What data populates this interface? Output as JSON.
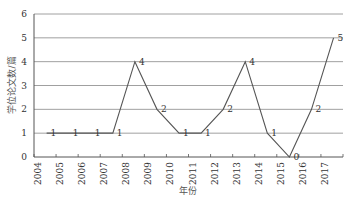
{
  "chart_data": {
    "type": "line",
    "title": "",
    "xlabel": "年份",
    "ylabel": "学位论文数/篇",
    "categories": [
      "2004",
      "2005",
      "2006",
      "2007",
      "2008",
      "2009",
      "2010",
      "2011",
      "2012",
      "2013",
      "2014",
      "2015",
      "2016",
      "2017"
    ],
    "series": [
      {
        "name": "学位论文数",
        "values": [
          1,
          1,
          1,
          1,
          4,
          2,
          1,
          1,
          2,
          4,
          1,
          0,
          2,
          5
        ]
      }
    ],
    "ylim": [
      0,
      6
    ],
    "yticks": [
      0,
      1,
      2,
      3,
      4,
      5,
      6
    ],
    "grid": true,
    "legend": "none",
    "data_labels": true,
    "colors": {
      "line": "#555555",
      "grid": "#888888",
      "axis": "#555555"
    }
  }
}
